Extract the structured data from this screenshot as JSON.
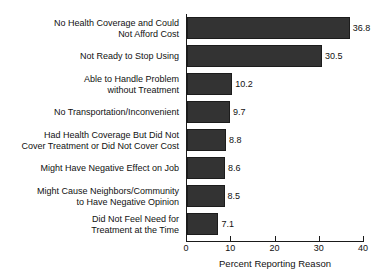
{
  "chart_data": {
    "type": "bar",
    "orientation": "horizontal",
    "title": "",
    "xlabel": "Percent Reporting Reason",
    "ylabel": "",
    "xlim": [
      0,
      40
    ],
    "xticks": [
      0,
      10,
      20,
      30,
      40
    ],
    "xtick_labels": [
      "0",
      "10",
      "20",
      "30",
      "40"
    ],
    "grid": false,
    "legend": false,
    "bar_color": "#333333",
    "bar_edge_color": "#1c1c1c",
    "background_color": "#ffffff",
    "text_color": "#111111",
    "categories": [
      "No Health Coverage and Could\nNot Afford Cost",
      "Not Ready to Stop Using",
      "Able to Handle Problem\nwithout Treatment",
      "No Transportation/Inconvenient",
      "Had Health Coverage But Did Not\nCover Treatment or Did Not Cover Cost",
      "Might Have Negative Effect on Job",
      "Might Cause Neighbors/Community\nto Have Negative Opinion",
      "Did Not Feel Need for\nTreatment at the Time"
    ],
    "values": [
      36.8,
      30.5,
      10.2,
      9.7,
      8.8,
      8.6,
      8.5,
      7.1
    ],
    "value_labels": [
      "36.8",
      "30.5",
      "10.2",
      "9.7",
      "8.8",
      "8.6",
      "8.5",
      "7.1"
    ]
  }
}
